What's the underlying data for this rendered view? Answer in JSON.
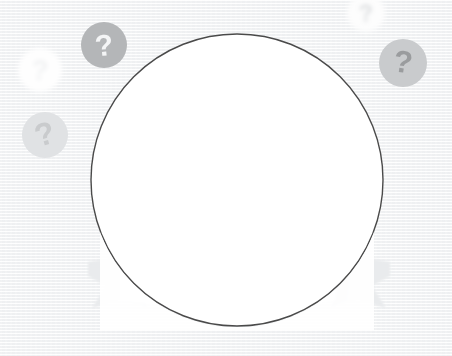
{
  "canvas": {
    "width": 452,
    "height": 356,
    "background_color": "#f6f7f8",
    "title": "Question mark badges around a blank circular frame"
  },
  "palette": {
    "background": "#f6f7f8",
    "circle_fill": "#ffffff",
    "circle_stroke": "#4a4a4a",
    "badge_strong_fill": "#b4b6b8",
    "badge_strong_glyph": "#f4f5f6",
    "badge_medium_fill": "#c9cbcd",
    "badge_medium_glyph": "#9a9c9e",
    "badge_faint_fill": "#e4e6e8",
    "badge_faint_glyph": "#d2d4d6",
    "badge_ghost_fill": "#fdfdfd",
    "badge_ghost_glyph": "#eceef0",
    "ribbon_fill": "#e9ebed",
    "ribbon_fold": "#dcdee0",
    "ribbon_band": "#fbfbfc"
  },
  "circle_frame": {
    "name": "main-circle-frame",
    "center_x": 237,
    "center_y": 180,
    "radius": 146,
    "stroke_width": 1.4,
    "fill": "#ffffff",
    "stroke": "#4a4a4a",
    "content": ""
  },
  "ribbon": {
    "name": "ribbon-banner",
    "band_label": "",
    "left_tail": {
      "x": 88,
      "y": 258,
      "width": 58,
      "height": 52
    },
    "right_tail": {
      "x": 332,
      "y": 258,
      "width": 58,
      "height": 52
    },
    "band": {
      "x": 120,
      "y": 272,
      "width": 215,
      "height": 40
    }
  },
  "badges": [
    {
      "id": "badge-1",
      "name": "question-badge-top-left",
      "glyph": "?",
      "center_x": 104,
      "center_y": 45,
      "radius": 23,
      "fill": "#b4b6b8",
      "glyph_color": "#f4f5f6",
      "glyph_size": 30,
      "rotation": -6,
      "opacity": 1
    },
    {
      "id": "badge-2",
      "name": "question-badge-right",
      "glyph": "?",
      "center_x": 403,
      "center_y": 63,
      "radius": 24,
      "fill": "#c9cbcd",
      "glyph_color": "#9a9c9e",
      "glyph_size": 31,
      "rotation": 8,
      "opacity": 1
    },
    {
      "id": "badge-3",
      "name": "question-badge-lower-left",
      "glyph": "?",
      "center_x": 45,
      "center_y": 135,
      "radius": 23,
      "fill": "#e0e2e4",
      "glyph_color": "#c9cbcd",
      "glyph_size": 32,
      "rotation": -16,
      "opacity": 1
    },
    {
      "id": "badge-4",
      "name": "question-badge-ghost-left",
      "glyph": "?",
      "center_x": 40,
      "center_y": 70,
      "radius": 22,
      "fill": "#fefefe",
      "glyph_color": "#f1f2f3",
      "glyph_size": 28,
      "rotation": 4,
      "opacity": 1
    },
    {
      "id": "badge-5",
      "name": "question-badge-ghost-top-right",
      "glyph": "?",
      "center_x": 366,
      "center_y": 13,
      "radius": 19,
      "fill": "#fdfdfd",
      "glyph_color": "#dcdee0",
      "glyph_size": 24,
      "rotation": -3,
      "opacity": 1
    }
  ],
  "caption": {
    "text": ""
  }
}
